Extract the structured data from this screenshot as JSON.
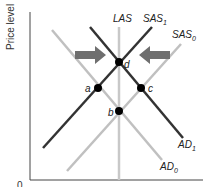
{
  "diagram": {
    "y_axis_label": "Price level",
    "origin_label": "0",
    "curves": {
      "las": {
        "label": "LAS",
        "color": "#c8c8c8"
      },
      "sas1": {
        "label": "SAS",
        "sub": "1",
        "color": "#333333"
      },
      "sas0": {
        "label": "SAS",
        "sub": "0",
        "color": "#c0c0c0"
      },
      "ad1": {
        "label": "AD",
        "sub": "1",
        "color": "#333333"
      },
      "ad0": {
        "label": "AD",
        "sub": "0",
        "color": "#c0c0c0"
      }
    },
    "points": {
      "a": "a",
      "b": "b",
      "c": "c",
      "d": "d"
    },
    "arrows": {
      "left_arrow": "right-pointing shift arrow",
      "right_arrow": "left-pointing shift arrow",
      "color": "#6f6f6f"
    }
  }
}
